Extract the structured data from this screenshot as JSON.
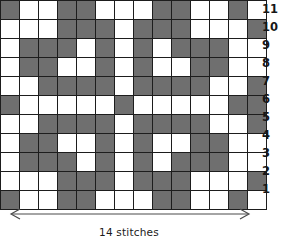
{
  "chart_data": {
    "type": "heatmap",
    "title": "",
    "xlabel": "14 stitches",
    "ylabel": "",
    "grid": true,
    "legend": "none",
    "columns": 14,
    "rows": 11,
    "x": [
      1,
      2,
      3,
      4,
      5,
      6,
      7,
      8,
      9,
      10,
      11,
      12,
      13,
      14
    ],
    "row_labels": [
      "11",
      "10",
      "9",
      "8",
      "7",
      "6",
      "5",
      "4",
      "3",
      "2",
      "1"
    ],
    "value_meaning": {
      "1": "filled stitch (grey)",
      "0": "empty stitch (white)"
    },
    "colors": {
      "filled": "#6f6f6f",
      "empty": "#ffffff",
      "gridline": "#1d1d1d",
      "text": "#161616"
    },
    "series": [
      {
        "name": "row-11",
        "values": [
          1,
          0,
          0,
          1,
          1,
          0,
          0,
          0,
          1,
          1,
          0,
          0,
          1,
          0
        ]
      },
      {
        "name": "row-10",
        "values": [
          0,
          0,
          0,
          1,
          1,
          1,
          0,
          1,
          1,
          1,
          0,
          0,
          0,
          1
        ]
      },
      {
        "name": "row-9",
        "values": [
          0,
          1,
          1,
          1,
          0,
          1,
          0,
          1,
          0,
          1,
          1,
          1,
          0,
          0
        ]
      },
      {
        "name": "row-8",
        "values": [
          0,
          1,
          1,
          0,
          0,
          1,
          0,
          1,
          0,
          0,
          1,
          1,
          0,
          0
        ]
      },
      {
        "name": "row-7",
        "values": [
          0,
          0,
          1,
          1,
          1,
          1,
          0,
          1,
          1,
          1,
          1,
          0,
          0,
          1
        ]
      },
      {
        "name": "row-6",
        "values": [
          1,
          0,
          0,
          0,
          0,
          0,
          1,
          0,
          0,
          0,
          0,
          0,
          1,
          1
        ]
      },
      {
        "name": "row-5",
        "values": [
          0,
          0,
          1,
          1,
          1,
          1,
          0,
          1,
          1,
          1,
          1,
          0,
          0,
          1
        ]
      },
      {
        "name": "row-4",
        "values": [
          0,
          1,
          1,
          0,
          0,
          1,
          0,
          1,
          0,
          0,
          1,
          1,
          0,
          0
        ]
      },
      {
        "name": "row-3",
        "values": [
          0,
          1,
          1,
          1,
          0,
          1,
          0,
          1,
          0,
          1,
          1,
          1,
          0,
          0
        ]
      },
      {
        "name": "row-2",
        "values": [
          0,
          0,
          0,
          1,
          1,
          1,
          0,
          1,
          1,
          1,
          0,
          0,
          0,
          1
        ]
      },
      {
        "name": "row-1",
        "values": [
          1,
          0,
          0,
          1,
          1,
          0,
          0,
          0,
          1,
          1,
          0,
          0,
          1,
          0
        ]
      }
    ]
  },
  "axis": {
    "width_caption": "14 stitches"
  }
}
